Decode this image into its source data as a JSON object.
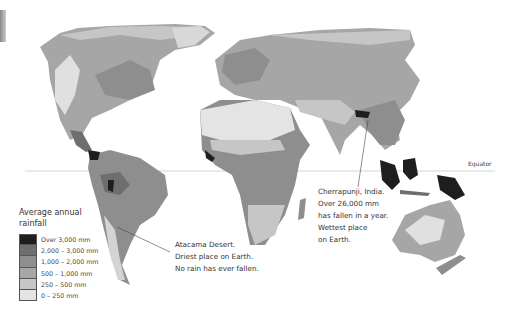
{
  "map": {
    "title": "Average annual rainfall",
    "equator_label": "Equator"
  },
  "legend": {
    "title_line1": "Average annual",
    "title_line2": "rainfall",
    "items": [
      {
        "label": "Over 3,000 mm",
        "color": "#1e1e1e"
      },
      {
        "label": "2,000 – 3,000 mm",
        "color": "#6e6e6e"
      },
      {
        "label": "1,000 – 2,000 mm",
        "color": "#8e8e8e"
      },
      {
        "label": "500 – 1,000 mm",
        "color": "#a6a6a6"
      },
      {
        "label": "250 – 500 mm",
        "color": "#c6c6c6"
      },
      {
        "label": "0 – 250 mm",
        "color": "#e4e4e4"
      }
    ]
  },
  "annotations": {
    "atacama": {
      "line1": "Atacama Desert.",
      "line2": "Driest place on Earth.",
      "line3": "No rain has ever fallen."
    },
    "cherrapunji": {
      "line1": "Cherrapunji, India.",
      "line2": "Over 26,000 mm",
      "line3": "has fallen in a year.",
      "line4": "Wettest place",
      "line5": "on Earth."
    }
  }
}
